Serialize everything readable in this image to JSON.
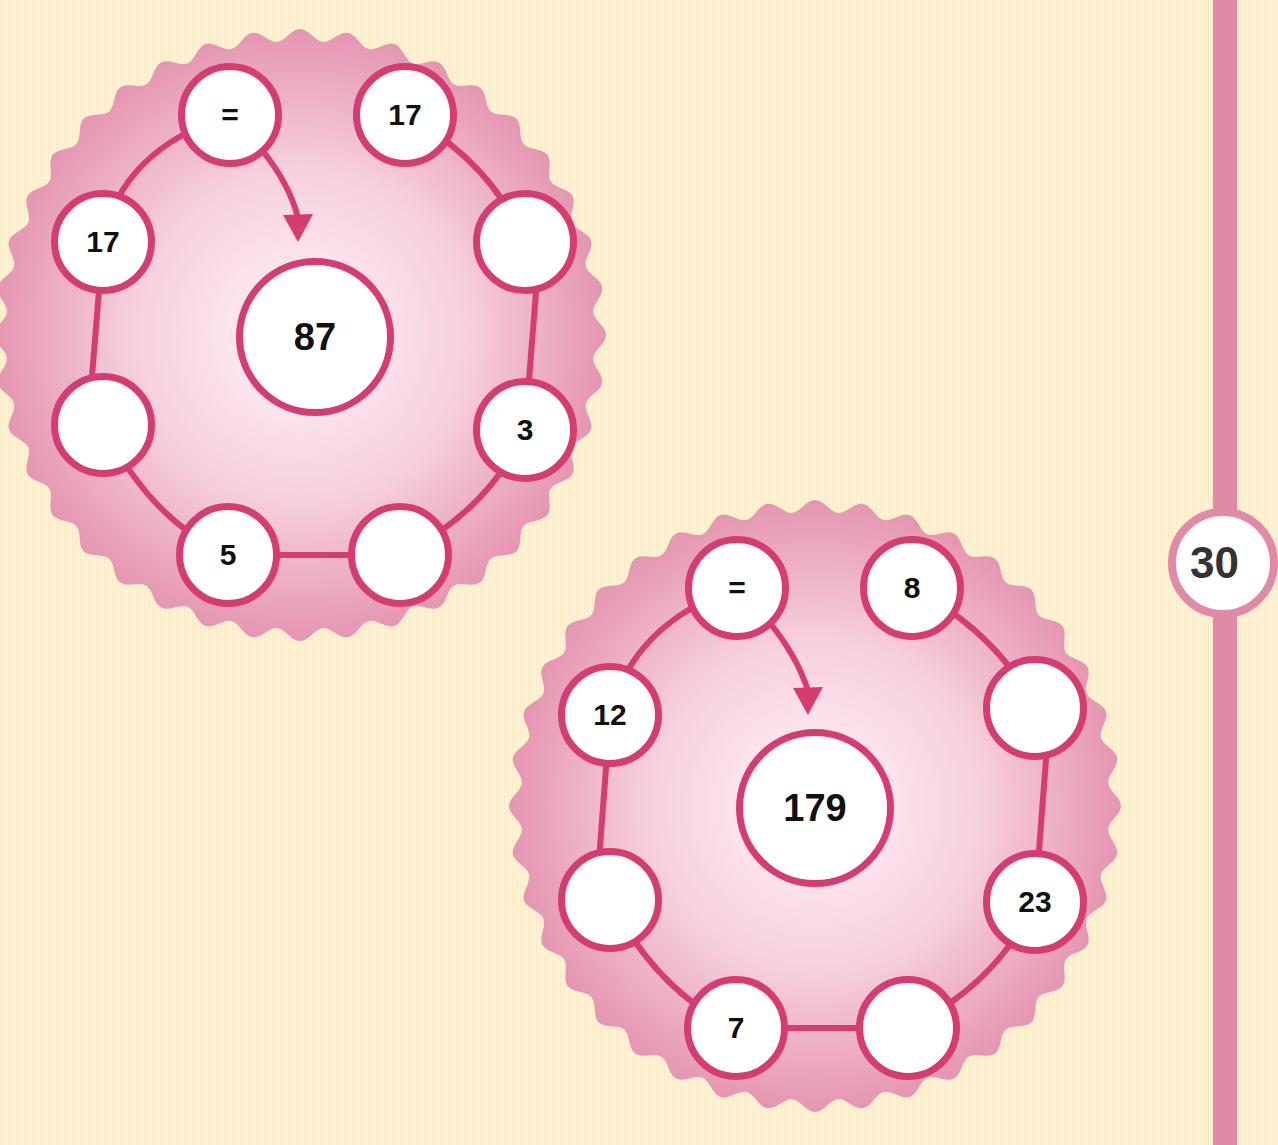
{
  "colors": {
    "background": "#fcf1d2",
    "wavy_disc": "#e89ab4",
    "ring_stroke": "#d63c6e",
    "node_fill": "#ffffff",
    "side_bar": "#e18aa8"
  },
  "page_number": "30",
  "puzzles": [
    {
      "center_target": "87",
      "nodes": [
        {
          "pos": "top-left",
          "value": "="
        },
        {
          "pos": "top-right",
          "value": "17"
        },
        {
          "pos": "right-upper",
          "value": ""
        },
        {
          "pos": "right-lower",
          "value": "3"
        },
        {
          "pos": "bottom-right",
          "value": ""
        },
        {
          "pos": "bottom-left",
          "value": "5"
        },
        {
          "pos": "left-lower",
          "value": ""
        },
        {
          "pos": "left-upper",
          "value": "17"
        }
      ]
    },
    {
      "center_target": "179",
      "nodes": [
        {
          "pos": "top-left",
          "value": "="
        },
        {
          "pos": "top-right",
          "value": "8"
        },
        {
          "pos": "right-upper",
          "value": ""
        },
        {
          "pos": "right-lower",
          "value": "23"
        },
        {
          "pos": "bottom-right",
          "value": ""
        },
        {
          "pos": "bottom-left",
          "value": "7"
        },
        {
          "pos": "left-lower",
          "value": ""
        },
        {
          "pos": "left-upper",
          "value": "12"
        }
      ]
    }
  ]
}
